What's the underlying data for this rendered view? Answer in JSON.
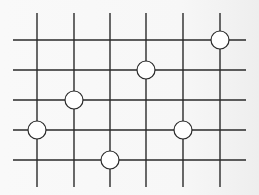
{
  "diagram": {
    "type": "grid-with-markers",
    "colors": {
      "line": "#2a2a2a",
      "marker_fill": "#ffffff",
      "marker_stroke": "#2a2a2a"
    },
    "grid": {
      "columns_x": [
        37,
        74,
        110,
        146,
        183,
        220
      ],
      "rows_y": [
        40,
        70,
        100,
        130,
        160
      ],
      "horizontal_extent": [
        13,
        246
      ],
      "vertical_extent": [
        13,
        187
      ]
    },
    "markers": [
      {
        "col": 6,
        "row": 1,
        "x": 220,
        "y": 40
      },
      {
        "col": 4,
        "row": 2,
        "x": 146,
        "y": 70
      },
      {
        "col": 2,
        "row": 3,
        "x": 74,
        "y": 100
      },
      {
        "col": 1,
        "row": 4,
        "x": 37,
        "y": 130
      },
      {
        "col": 5,
        "row": 4,
        "x": 183,
        "y": 130
      },
      {
        "col": 3,
        "row": 5,
        "x": 110,
        "y": 160
      }
    ],
    "marker_radius": 9
  }
}
